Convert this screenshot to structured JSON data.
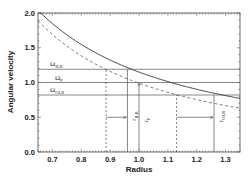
{
  "chart_data": {
    "type": "line",
    "title": "",
    "xlabel": "Radius",
    "ylabel": "Angular velocity",
    "xlim": [
      0.65,
      1.35
    ],
    "ylim": [
      0.0,
      2.0
    ],
    "x_ticks": [
      "0.7",
      "0.8",
      "0.9",
      "1.0",
      "1.1",
      "1.2",
      "1.3"
    ],
    "y_ticks": [
      "0.0",
      "0.5",
      "1.0",
      "1.5",
      "2.0"
    ],
    "grid": false,
    "series": [
      {
        "name": "Omega (solid curve)",
        "style": "solid",
        "x": [
          0.655,
          0.7,
          0.8,
          0.9,
          0.96,
          1.0,
          1.1,
          1.2,
          1.26,
          1.3,
          1.35
        ],
        "y": [
          2.02,
          1.85,
          1.55,
          1.32,
          1.21,
          1.15,
          1.01,
          0.9,
          0.84,
          0.81,
          0.77
        ]
      },
      {
        "name": "Omega - kappa/2 (dashed curve)",
        "style": "dashed",
        "x": [
          0.65,
          0.7,
          0.8,
          0.886,
          0.9,
          1.0,
          1.1,
          1.13,
          1.2,
          1.3,
          1.35
        ],
        "y": [
          1.89,
          1.69,
          1.38,
          1.19,
          1.16,
          0.99,
          0.86,
          0.82,
          0.75,
          0.67,
          0.63
        ]
      }
    ],
    "horizontal_lines": [
      {
        "label": "Ω_ILR",
        "y": 1.19
      },
      {
        "label": "Ω_p",
        "y": 1.0
      },
      {
        "label": "Ω_OLR",
        "y": 0.82
      }
    ],
    "vertical_lines": [
      {
        "x": 0.886,
        "style": "dashed"
      },
      {
        "x": 0.96,
        "style": "solid",
        "label": "r_ILR"
      },
      {
        "x": 1.0,
        "style": "solid",
        "label": "r_p"
      },
      {
        "x": 1.13,
        "style": "dashed"
      },
      {
        "x": 1.26,
        "style": "solid",
        "label": "r_OLR"
      }
    ],
    "arrows": [
      {
        "from": [
          0.886,
          0.5
        ],
        "to": [
          0.96,
          0.5
        ]
      },
      {
        "from": [
          1.13,
          0.5
        ],
        "to": [
          1.26,
          0.5
        ]
      },
      {
        "from": [
          1.0,
          0.0
        ],
        "to": [
          1.0,
          0.99
        ]
      }
    ]
  },
  "labels": {
    "omega_ilr": {
      "main": "Ω",
      "sub": "ILR"
    },
    "omega_p": {
      "main": "Ω",
      "sub": "p"
    },
    "omega_olr": {
      "main": "Ω",
      "sub": "OLR"
    },
    "r_ilr": {
      "main": "r",
      "sub": "ILR"
    },
    "r_p": {
      "main": "r",
      "sub": "p"
    },
    "r_olr": {
      "main": "r",
      "sub": "OLR"
    }
  }
}
